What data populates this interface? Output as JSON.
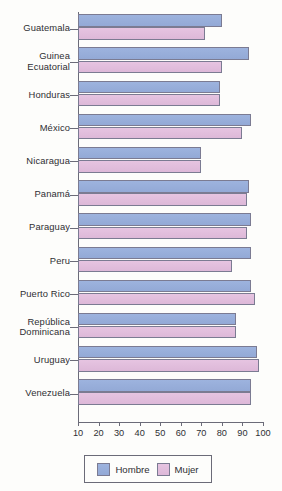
{
  "chart_data": {
    "type": "bar",
    "orientation": "horizontal",
    "title": "",
    "xlabel": "",
    "ylabel": "",
    "xlim": [
      10,
      100
    ],
    "xticks": [
      10,
      20,
      30,
      40,
      50,
      60,
      70,
      80,
      90,
      100
    ],
    "grid": false,
    "legend_position": "bottom",
    "categories": [
      "Guatemala",
      "Guinea\nEcuatorial",
      "Honduras",
      "México",
      "Nicaragua",
      "Panamá",
      "Paraguay",
      "Peru",
      "Puerto Rico",
      "República\nDominicana",
      "Uruguay",
      "Venezuela"
    ],
    "series": [
      {
        "name": "Hombre",
        "color": "#97aedb",
        "values": [
          80,
          93,
          79,
          94,
          70,
          93,
          94,
          94,
          94,
          87,
          97,
          94
        ]
      },
      {
        "name": "Mujer",
        "color": "#e3bedd",
        "values": [
          72,
          80,
          79,
          90,
          70,
          92,
          92,
          85,
          96,
          87,
          98,
          94
        ]
      }
    ]
  },
  "legend": {
    "items": [
      {
        "label": "Hombre",
        "swatch": "hombre-swatch"
      },
      {
        "label": "Mujer",
        "swatch": "mujer-swatch"
      }
    ]
  }
}
